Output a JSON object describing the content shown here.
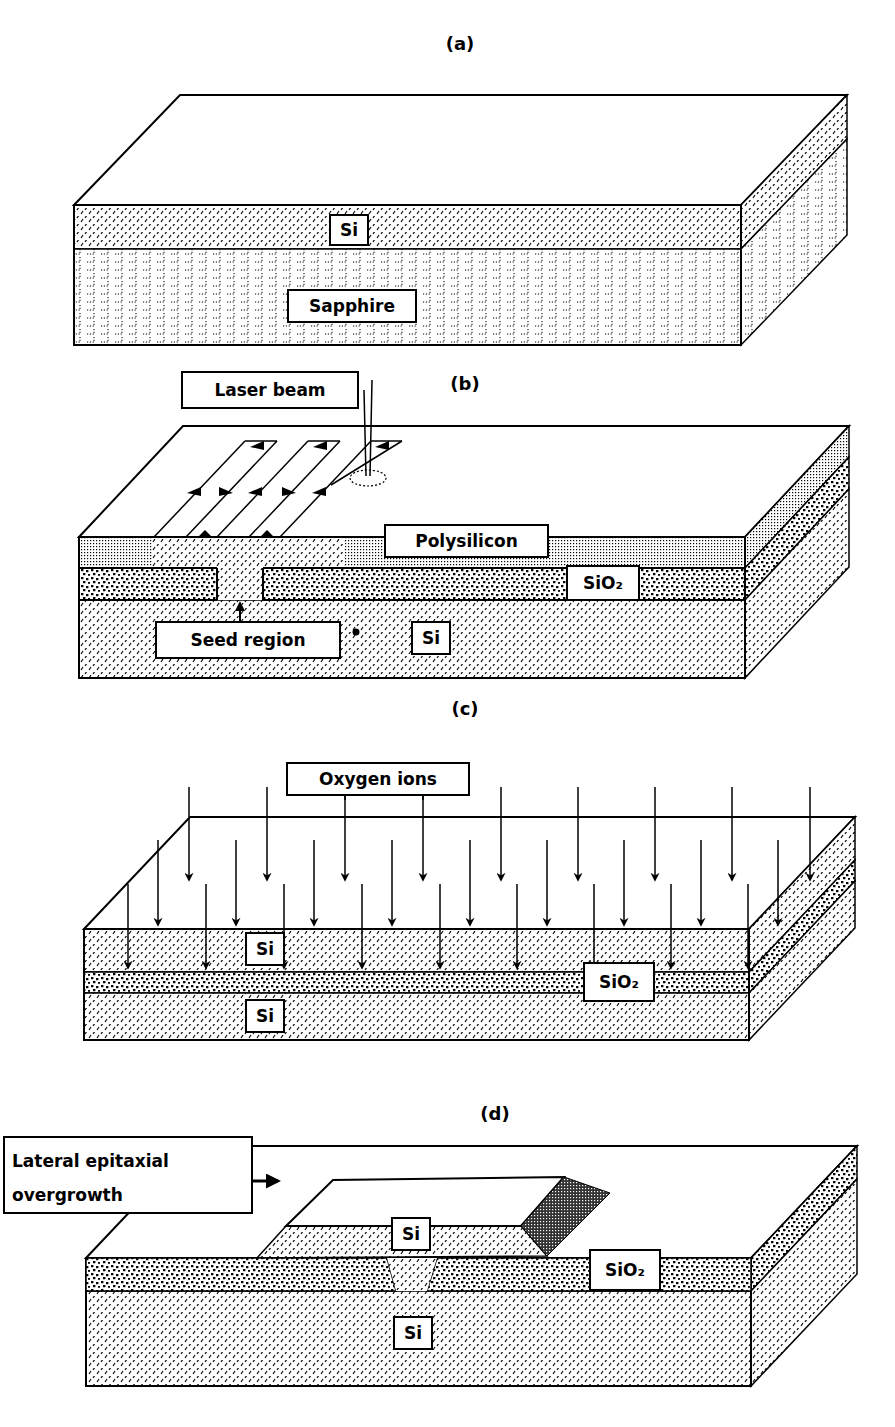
{
  "figure": {
    "background": "#ffffff",
    "ink": "#000000",
    "panels": [
      {
        "id": "a",
        "label": "(a)",
        "label_pos": [
          460,
          50
        ],
        "title": "Silicon-on-sapphire",
        "box": {
          "front_left": 74,
          "front_right": 741,
          "front_top": 205,
          "front_bottom": 345,
          "depth_dx": 106,
          "depth_dy": -110
        },
        "layers": [
          {
            "name": "Si",
            "top": 205,
            "bottom": 249,
            "pattern": "diag"
          },
          {
            "name": "Sapphire",
            "top": 249,
            "bottom": 345,
            "pattern": "brick"
          }
        ],
        "labels": [
          {
            "text": "Si",
            "x": 330,
            "y": 215,
            "w": 38,
            "h": 30
          },
          {
            "text": "Sapphire",
            "x": 288,
            "y": 290,
            "w": 128,
            "h": 32
          }
        ]
      },
      {
        "id": "b",
        "label": "(b)",
        "label_pos": [
          465,
          390
        ],
        "title": "Laser recrystallization",
        "box": {
          "front_left": 79,
          "front_right": 745,
          "front_top": 537,
          "front_bottom": 678,
          "depth_dx": 104,
          "depth_dy": -111
        },
        "layers": [
          {
            "name": "Polysilicon",
            "top": 537,
            "bottom": 568,
            "pattern": "fine"
          },
          {
            "name": "SiO2",
            "top": 568,
            "bottom": 600,
            "pattern": "coarse"
          },
          {
            "name": "Si",
            "top": 600,
            "bottom": 678,
            "pattern": "diag"
          }
        ],
        "seed": {
          "left": 217,
          "right": 263
        },
        "recrystallized_span": {
          "left": 152,
          "right": 345
        },
        "labels": [
          {
            "text": "Laser beam",
            "x": 182,
            "y": 372,
            "w": 176,
            "h": 36
          },
          {
            "text": "Polysilicon",
            "x": 385,
            "y": 525,
            "w": 163,
            "h": 32
          },
          {
            "text": "SiO₂",
            "x": 567,
            "y": 566,
            "w": 72,
            "h": 34
          },
          {
            "text": "Seed region",
            "x": 156,
            "y": 622,
            "w": 184,
            "h": 36
          },
          {
            "text": "Si",
            "x": 412,
            "y": 622,
            "w": 38,
            "h": 32
          }
        ],
        "scan_lines": [
          [
            154,
            537,
            245,
            441
          ],
          [
            186,
            537,
            277,
            441
          ],
          [
            217,
            537,
            308,
            441
          ],
          [
            249,
            537,
            340,
            441
          ],
          [
            280,
            537,
            371,
            441
          ],
          [
            331,
            485,
            402,
            441
          ]
        ],
        "laser": {
          "x": 368,
          "top": 380,
          "bottom": 476,
          "spot_cx": 368,
          "spot_cy": 478,
          "spot_rx": 18,
          "spot_ry": 8
        }
      },
      {
        "id": "c",
        "label": "(c)",
        "label_pos": [
          465,
          715
        ],
        "title": "Oxygen implantation (SIMOX)",
        "box": {
          "front_left": 84,
          "front_right": 749,
          "front_top": 929,
          "front_bottom": 1040,
          "depth_dx": 106,
          "depth_dy": -112
        },
        "layers": [
          {
            "name": "Si",
            "top": 929,
            "bottom": 972,
            "pattern": "diag"
          },
          {
            "name": "SiO2",
            "top": 972,
            "bottom": 993,
            "pattern": "coarse"
          },
          {
            "name": "Si",
            "top": 993,
            "bottom": 1040,
            "pattern": "diag"
          }
        ],
        "labels": [
          {
            "text": "Oxygen ions",
            "x": 287,
            "y": 763,
            "w": 182,
            "h": 32
          },
          {
            "text": "Si",
            "x": 246,
            "y": 933,
            "w": 38,
            "h": 32
          },
          {
            "text": "SiO₂",
            "x": 584,
            "y": 963,
            "w": 70,
            "h": 38
          },
          {
            "text": "Si",
            "x": 246,
            "y": 1000,
            "w": 38,
            "h": 32
          }
        ],
        "ion_arrows": {
          "rows": [
            {
              "y1": 787,
              "y2": 880,
              "xs": [
                189,
                267,
                345,
                423,
                501,
                578,
                655,
                732,
                810
              ]
            },
            {
              "y1": 840,
              "y2": 925,
              "xs": [
                158,
                236,
                314,
                392,
                470,
                547,
                624,
                701,
                778
              ]
            },
            {
              "y1": 884,
              "y2": 968,
              "xs": [
                128,
                206,
                284,
                362,
                440,
                517,
                594,
                671,
                748
              ]
            }
          ]
        }
      },
      {
        "id": "d",
        "label": "(d)",
        "label_pos": [
          495,
          1120
        ],
        "title": "Lateral epitaxial overgrowth",
        "box": {
          "front_left": 86,
          "front_right": 751,
          "front_top": 1258,
          "front_bottom": 1386,
          "depth_dx": 106,
          "depth_dy": -112
        },
        "layers": [
          {
            "name": "SiO2",
            "top": 1258,
            "bottom": 1291,
            "pattern": "coarse"
          },
          {
            "name": "Si",
            "top": 1291,
            "bottom": 1386,
            "pattern": "diag"
          }
        ],
        "seed": {
          "top_left": 387,
          "bottom_left": 396,
          "top_right": 437,
          "bottom_right": 427
        },
        "mesa": {
          "front_top_left": [
            286,
            1226
          ],
          "front_top_right": [
            521,
            1226
          ],
          "back_top_left": [
            333,
            1180
          ],
          "back_top_right": [
            564,
            1177
          ],
          "side_far": [
            610,
            1193
          ],
          "side_bottom": [
            547,
            1256
          ],
          "front_bottom_left": [
            257,
            1258
          ]
        },
        "labels": [
          {
            "text": "Lateral epitaxial",
            "text2": "overgrowth",
            "x": 4,
            "y": 1137,
            "w": 248,
            "h": 76
          },
          {
            "text": "Si",
            "x": 392,
            "y": 1218,
            "w": 38,
            "h": 32
          },
          {
            "text": "SiO₂",
            "x": 590,
            "y": 1250,
            "w": 70,
            "h": 40
          },
          {
            "text": "Si",
            "x": 394,
            "y": 1317,
            "w": 38,
            "h": 32
          }
        ],
        "pointer_arrow": {
          "x1": 253,
          "y1": 1181,
          "x2": 278,
          "y2": 1181
        }
      }
    ]
  }
}
